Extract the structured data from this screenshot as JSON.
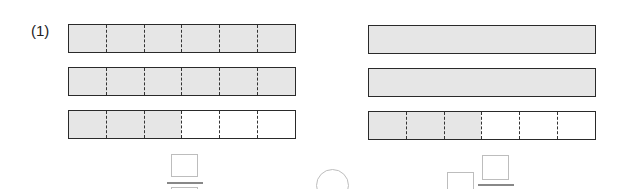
{
  "problem": {
    "label": "(1)"
  },
  "left_bars": [
    {
      "divisions": 6,
      "shaded": 6
    },
    {
      "divisions": 6,
      "shaded": 6
    },
    {
      "divisions": 6,
      "shaded": 3
    }
  ],
  "right_bars": [
    {
      "divisions": 1,
      "shaded": 1
    },
    {
      "divisions": 1,
      "shaded": 1
    },
    {
      "divisions": 6,
      "shaded": 3
    }
  ],
  "answer": {
    "left": "fraction-blank",
    "middle": "comparison-circle-blank",
    "right": "mixed-number-blank"
  },
  "colors": {
    "shade": "#e6e6e6",
    "border": "#2a2a2a",
    "blank": "#bdbdbd"
  }
}
